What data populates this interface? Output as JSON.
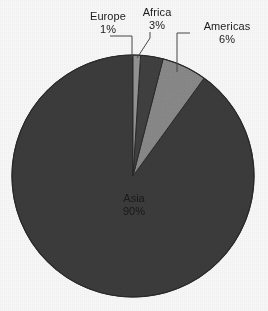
{
  "chart_data": {
    "type": "pie",
    "title": "",
    "subtitle": "",
    "xlabel": "",
    "ylabel": "",
    "legend_position": "none",
    "grid": false,
    "categories": [
      "Europe",
      "Africa",
      "Americas",
      "Asia"
    ],
    "values": [
      1,
      3,
      6,
      90
    ],
    "value_unit": "%",
    "slices": [
      {
        "label": "Europe",
        "value": 1,
        "percent_text": "1%",
        "color": "#9a9a9a",
        "start_angle_deg": 0,
        "end_angle_deg": 3.6,
        "label_placement": "outside-callout"
      },
      {
        "label": "Africa",
        "value": 3,
        "percent_text": "3%",
        "color": "#434343",
        "start_angle_deg": 3.6,
        "end_angle_deg": 14.4,
        "label_placement": "outside-callout"
      },
      {
        "label": "Americas",
        "value": 6,
        "percent_text": "6%",
        "color": "#8f8f8f",
        "start_angle_deg": 14.4,
        "end_angle_deg": 36.0,
        "label_placement": "outside-callout"
      },
      {
        "label": "Asia",
        "value": 90,
        "percent_text": "90%",
        "color": "#3f3f3f",
        "start_angle_deg": 36.0,
        "end_angle_deg": 360.0,
        "label_placement": "inside"
      }
    ]
  },
  "labels": {
    "europe": {
      "name": "Europe",
      "percent": "1%"
    },
    "africa": {
      "name": "Africa",
      "percent": "3%"
    },
    "americas": {
      "name": "Americas",
      "percent": "6%"
    },
    "asia": {
      "name": "Asia",
      "percent": "90%"
    }
  },
  "geometry": {
    "center_x": 133,
    "center_y": 176,
    "radius": 121
  },
  "colors": {
    "background": "#ffffff",
    "asia": "#3f3f3f",
    "americas": "#8f8f8f",
    "africa": "#434343",
    "europe": "#9a9a9a",
    "outline": "#2b2b2b",
    "leader_line": "#4a4a4a",
    "label_text": "#1d1d1d"
  }
}
